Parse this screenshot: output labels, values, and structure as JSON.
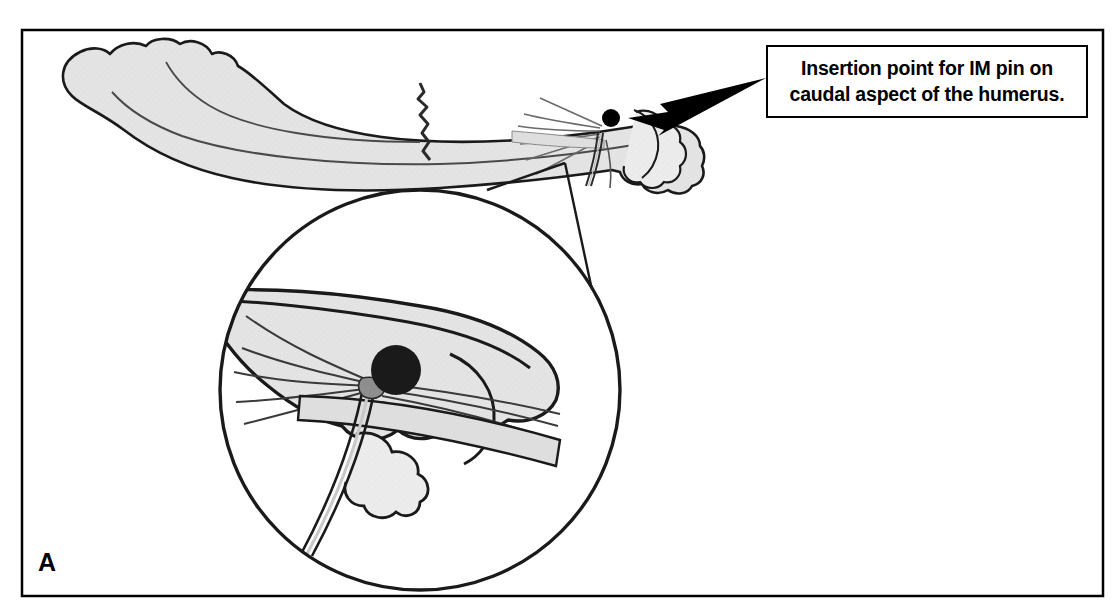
{
  "figure": {
    "panel_label": "A",
    "caption_lines": [
      "Insertion point for IM pin on",
      "caudal aspect of the humerus."
    ],
    "caption_full": "Insertion point for IM pin on caudal aspect of the humerus.",
    "subject": "humerus",
    "colors": {
      "bone_fill": "#e4e4e4",
      "bone_fill_light": "#ececec",
      "outline": "#1a1a1a",
      "insertion_marker": "#000000",
      "frame": "#000000",
      "background": "#ffffff"
    },
    "structures": [
      "proximal humerus head",
      "humeral shaft",
      "transverse fracture line",
      "distal humeral condyle",
      "olecranon fossa",
      "triceps tendon fibers",
      "intramedullary pin",
      "insertion point marker"
    ],
    "annotations": {
      "insertion_marker_label": "insertion point",
      "arrow_direction": "right-to-left",
      "magnifier_label": "magnified inset of caudal distal humerus"
    }
  }
}
